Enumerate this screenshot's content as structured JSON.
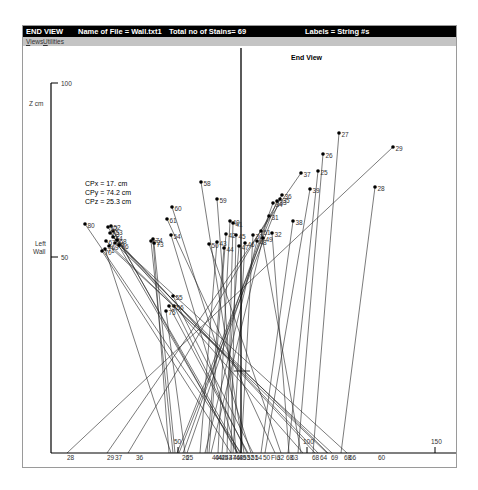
{
  "window": {
    "title_view": "END VIEW",
    "title_file": "Name of File = Wall.txt1",
    "title_total": "Total no of Stains=  69",
    "title_labels": "Labels = String #s"
  },
  "menu": [
    {
      "label": "Views"
    },
    {
      "label": "Utilities"
    }
  ],
  "plot": {
    "title": "End View",
    "cp": {
      "x": "CPx = 17. cm",
      "y": "CPy = 74.2 cm",
      "z": "CPz = 25.3 cm"
    },
    "y_axis_label": "Z cm",
    "left_wall_label_1": "Left",
    "left_wall_label_2": "Wall",
    "y_ticks": [
      {
        "label": "100",
        "y": 37
      },
      {
        "label": "50",
        "y": 211
      }
    ],
    "x_ticks": [
      {
        "label": "50",
        "x": 155
      },
      {
        "label": "100",
        "x": 284
      },
      {
        "label": "150",
        "x": 412
      }
    ],
    "axis": {
      "x0": 28,
      "y0": 407,
      "x_end": 435,
      "y_top": 37,
      "vline_x": 218
    },
    "crosshair": {
      "x": 219,
      "y": 325
    }
  },
  "chart_data": {
    "type": "scatter",
    "title": "End View",
    "xlabel": "",
    "ylabel": "Z cm",
    "xlim": [
      0,
      150
    ],
    "ylim": [
      0,
      100
    ],
    "annotations": [
      "CPx = 17. cm",
      "CPy = 74.2 cm",
      "CPz = 25.3 cm",
      "Left Wall"
    ],
    "points": [
      {
        "id": "27",
        "x": 338,
        "y": 112,
        "bx": 312
      },
      {
        "id": "26",
        "x": 322,
        "y": 133,
        "bx": 297
      },
      {
        "id": "29",
        "x": 392,
        "y": 126,
        "bx": 66
      },
      {
        "id": "25",
        "x": 317,
        "y": 150,
        "bx": 287
      },
      {
        "id": "37",
        "x": 300,
        "y": 152,
        "bx": 106
      },
      {
        "id": "28",
        "x": 374,
        "y": 166,
        "bx": 340
      },
      {
        "id": "39",
        "x": 309,
        "y": 168,
        "bx": 264
      },
      {
        "id": "36",
        "x": 281,
        "y": 174,
        "bx": 127
      },
      {
        "id": "35",
        "x": 279,
        "y": 178,
        "bx": 178
      },
      {
        "id": "34",
        "x": 272,
        "y": 182,
        "bx": 182
      },
      {
        "id": "33",
        "x": 276,
        "y": 180,
        "bx": 176
      },
      {
        "id": "31",
        "x": 268,
        "y": 195,
        "bx": 186
      },
      {
        "id": "38",
        "x": 292,
        "y": 200,
        "bx": 260
      },
      {
        "id": "32",
        "x": 271,
        "y": 212,
        "bx": 288
      },
      {
        "id": "30",
        "x": 252,
        "y": 214,
        "bx": 240
      },
      {
        "id": "58",
        "x": 200,
        "y": 161,
        "bx": 243
      },
      {
        "id": "59",
        "x": 216,
        "y": 178,
        "bx": 235
      },
      {
        "id": "60",
        "x": 171,
        "y": 186,
        "bx": 250
      },
      {
        "id": "61",
        "x": 166,
        "y": 198,
        "bx": 274
      },
      {
        "id": "40",
        "x": 229,
        "y": 200,
        "bx": 217
      },
      {
        "id": "41",
        "x": 232,
        "y": 202,
        "bx": 226
      },
      {
        "id": "42",
        "x": 225,
        "y": 213,
        "bx": 208
      },
      {
        "id": "45",
        "x": 235,
        "y": 214,
        "bx": 230
      },
      {
        "id": "43",
        "x": 216,
        "y": 221,
        "bx": 199
      },
      {
        "id": "44",
        "x": 223,
        "y": 227,
        "bx": 206
      },
      {
        "id": "47",
        "x": 238,
        "y": 225,
        "bx": 221
      },
      {
        "id": "46",
        "x": 244,
        "y": 222,
        "bx": 232
      },
      {
        "id": "48",
        "x": 256,
        "y": 220,
        "bx": 204
      },
      {
        "id": "49",
        "x": 262,
        "y": 217,
        "bx": 210
      },
      {
        "id": "50",
        "x": 208,
        "y": 223,
        "bx": 280
      },
      {
        "id": "51",
        "x": 260,
        "y": 210,
        "bx": 300
      },
      {
        "id": "52",
        "x": 110,
        "y": 205,
        "bx": 236
      },
      {
        "id": "53",
        "x": 112,
        "y": 210,
        "bx": 239
      },
      {
        "id": "54",
        "x": 170,
        "y": 214,
        "bx": 236
      },
      {
        "id": "55",
        "x": 172,
        "y": 275,
        "bx": 252
      },
      {
        "id": "56",
        "x": 173,
        "y": 285,
        "bx": 246
      },
      {
        "id": "57",
        "x": 168,
        "y": 285,
        "bx": 247
      },
      {
        "id": "62",
        "x": 107,
        "y": 206,
        "bx": 237
      },
      {
        "id": "63",
        "x": 109,
        "y": 212,
        "bx": 302
      },
      {
        "id": "64",
        "x": 112,
        "y": 216,
        "bx": 317
      },
      {
        "id": "65",
        "x": 114,
        "y": 222,
        "bx": 327
      },
      {
        "id": "66",
        "x": 118,
        "y": 224,
        "bx": 346
      },
      {
        "id": "67",
        "x": 105,
        "y": 220,
        "bx": 326
      },
      {
        "id": "68",
        "x": 116,
        "y": 219,
        "bx": 314
      },
      {
        "id": "69",
        "x": 108,
        "y": 225,
        "bx": 331
      },
      {
        "id": "70",
        "x": 101,
        "y": 230,
        "bx": 230
      },
      {
        "id": "71",
        "x": 104,
        "y": 228,
        "bx": 170
      },
      {
        "id": "72",
        "x": 150,
        "y": 220,
        "bx": 172
      },
      {
        "id": "73",
        "x": 153,
        "y": 222,
        "bx": 174
      },
      {
        "id": "74",
        "x": 152,
        "y": 218,
        "bx": 168
      },
      {
        "id": "75",
        "x": 165,
        "y": 290,
        "bx": 184
      },
      {
        "id": "80",
        "x": 84,
        "y": 203,
        "bx": 240
      }
    ],
    "x_baseline_labels": [
      "28",
      "29",
      "37",
      "36",
      "26",
      "25",
      "40",
      "44",
      "42",
      "45",
      "43",
      "47",
      "46",
      "48",
      "49",
      "53",
      "52",
      "51",
      "54",
      "50",
      "Flo",
      "32",
      "68",
      "63",
      "68",
      "64",
      "69",
      "68",
      "66",
      "60"
    ]
  }
}
